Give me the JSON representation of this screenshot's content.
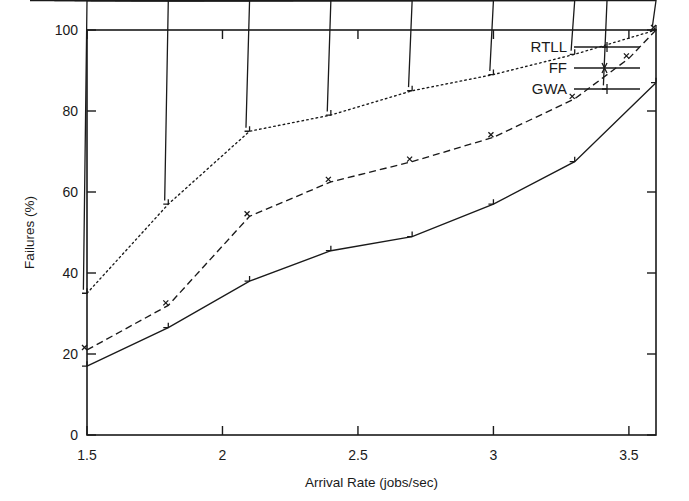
{
  "chart_data": {
    "type": "line",
    "title": "",
    "xlabel": "Arrival Rate (jobs/sec)",
    "ylabel": "Failures (%)",
    "xlim": [
      1.5,
      3.6
    ],
    "ylim": [
      0,
      100
    ],
    "xticks": [
      1.5,
      2,
      2.5,
      3,
      3.5
    ],
    "xticklabels": [
      "1.5",
      "2",
      "2.5",
      "3",
      "3.5"
    ],
    "yticks": [
      0,
      20,
      40,
      60,
      80,
      100
    ],
    "yticklabels": [
      "0",
      "20",
      "40",
      "60",
      "80",
      "100"
    ],
    "grid": false,
    "legend_position": "top-right",
    "x": [
      1.5,
      1.8,
      2.1,
      2.4,
      2.7,
      3.0,
      3.3,
      3.6
    ],
    "series": [
      {
        "name": "RTLL",
        "marker": "plus",
        "linestyle": "solid",
        "color": "#1a1a1a",
        "x": [
          1.5,
          1.8,
          2.1,
          2.4,
          2.7,
          3.0,
          3.3,
          3.6
        ],
        "values": [
          17,
          26.5,
          38,
          45.5,
          49,
          57,
          67.5,
          87
        ]
      },
      {
        "name": "FF",
        "marker": "cross",
        "linestyle": "dashed",
        "color": "#1a1a1a",
        "x": [
          1.5,
          1.8,
          2.1,
          2.4,
          2.7,
          3.0,
          3.3,
          3.5,
          3.6
        ],
        "values": [
          21,
          32,
          54,
          62.5,
          67.5,
          73.5,
          83,
          93,
          100
        ]
      },
      {
        "name": "GWA",
        "marker": "star",
        "linestyle": "dotted",
        "color": "#1a1a1a",
        "x": [
          1.5,
          1.8,
          2.1,
          2.4,
          2.7,
          3.0,
          3.3,
          3.6
        ],
        "values": [
          35,
          57,
          75,
          79,
          85,
          89,
          94,
          100
        ]
      }
    ]
  },
  "legend": {
    "entries": [
      {
        "label": "RTLL"
      },
      {
        "label": "FF"
      },
      {
        "label": "GWA"
      }
    ]
  },
  "axes": {
    "x_title": "Arrival Rate (jobs/sec)",
    "y_title": "Failures (%)"
  }
}
